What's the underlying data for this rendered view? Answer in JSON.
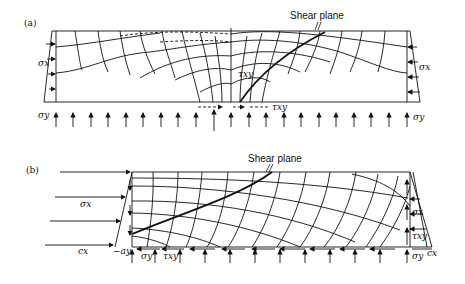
{
  "panel_a": {
    "label": "(a)",
    "shear_plane_label": "Shear plane",
    "sigma_x_left": "σx",
    "sigma_x_right": "σx",
    "sigma_y_left": "σy",
    "sigma_y_right": "σy",
    "tau_xy_center": "τxy",
    "tau_xy_bottom": "τxy"
  },
  "panel_b": {
    "label": "(b)",
    "shear_plane_label": "Shear plane",
    "sigma_x_left": "σx",
    "cx_left": "cx",
    "minus_ay": "−ay",
    "sigma_y_bottom": "σy",
    "tau_xy_bottom": "τxy",
    "sigma_x_right": "σx",
    "tau_xy_right": "τxy",
    "sigma_y_right": "σy",
    "cx_right": "cx"
  },
  "colors": {
    "line": "#111111",
    "background": "#ffffff"
  }
}
